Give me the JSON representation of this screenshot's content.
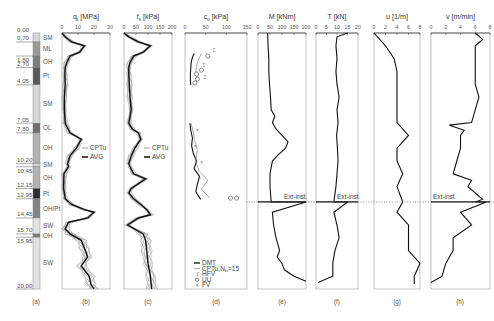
{
  "figure": {
    "depth_axis": {
      "min": 0,
      "max": 20,
      "unit": "m"
    },
    "column_a": {
      "caption": "(a)",
      "boundaries": [
        "0,00",
        "0,70",
        "1,80",
        "2,70",
        "4,05",
        "7,05",
        "7,80",
        "10,20",
        "10,45",
        "12,15",
        "12,95",
        "14,45",
        "15,70",
        "15,95",
        "20,00"
      ],
      "layers": [
        {
          "label": "SM",
          "top": 0.0,
          "bottom": 0.7,
          "shade": "#d6d6d6"
        },
        {
          "label": "ML",
          "top": 0.7,
          "bottom": 1.8,
          "shade": "#9a9a9a"
        },
        {
          "label": "OH",
          "top": 1.8,
          "bottom": 2.7,
          "shade": "#7d7d7d"
        },
        {
          "label": "Pt",
          "top": 2.7,
          "bottom": 4.05,
          "shade": "#585858"
        },
        {
          "label": "SM",
          "top": 4.05,
          "bottom": 7.05,
          "shade": "#d6d6d6"
        },
        {
          "label": "OL",
          "top": 7.05,
          "bottom": 7.8,
          "shade": "#6e6e6e"
        },
        {
          "label": "OH",
          "top": 7.8,
          "bottom": 10.2,
          "shade": "#b2b2b2"
        },
        {
          "label": "SM",
          "top": 10.2,
          "bottom": 10.45,
          "shade": "#d6d6d6"
        },
        {
          "label": "OH",
          "top": 10.45,
          "bottom": 12.15,
          "shade": "#b2b2b2"
        },
        {
          "label": "Pt",
          "top": 12.15,
          "bottom": 12.95,
          "shade": "#2e2e2e"
        },
        {
          "label": "OH/Pt",
          "top": 12.95,
          "bottom": 14.45,
          "shade": "#858585"
        },
        {
          "label": "SW",
          "top": 14.45,
          "bottom": 15.7,
          "shade": "#e2e2e2"
        },
        {
          "label": "OH",
          "top": 15.7,
          "bottom": 15.95,
          "shade": "#7d7d7d"
        },
        {
          "label": "SW",
          "top": 15.95,
          "bottom": 20.0,
          "shade": "#e2e2e2"
        }
      ]
    },
    "ext_inst_label": "Ext-inst.",
    "ext_inst_depth": 13.2
  },
  "chart_data": [
    {
      "type": "line",
      "panel": "(b)",
      "title": "q_t [MPa]",
      "title_main": "q",
      "title_sub": "t",
      "title_unit": " [MPa]",
      "xlim": [
        0,
        30
      ],
      "xticks": [
        "0",
        "10",
        "20",
        "30"
      ],
      "legend": [
        "CPTu",
        "AVG"
      ],
      "series": [
        {
          "name": "AVG",
          "depth": [
            0,
            0.3,
            0.7,
            1.0,
            1.5,
            1.8,
            2.3,
            2.7,
            3.2,
            4.05,
            5,
            6,
            7.05,
            7.3,
            7.8,
            8.3,
            9.0,
            9.6,
            10.2,
            10.45,
            11,
            12.15,
            12.5,
            12.95,
            13.4,
            13.8,
            14.0,
            14.45,
            14.8,
            15.3,
            15.7,
            16.2,
            16.8,
            17.5,
            18.2,
            19,
            19.6,
            20
          ],
          "values": [
            0,
            2,
            6,
            14,
            11,
            5,
            3,
            2,
            1.8,
            2,
            1.5,
            1.5,
            2,
            3,
            5,
            12,
            9,
            5,
            3.5,
            4,
            1.2,
            1.0,
            1.5,
            2,
            6,
            14,
            20,
            16,
            4,
            2,
            5,
            12,
            14,
            16,
            12,
            17,
            18,
            20
          ]
        }
      ]
    },
    {
      "type": "line",
      "panel": "(c)",
      "title": "f_s [kPa]",
      "title_main": "f",
      "title_sub": "s",
      "title_unit": " [kPa]",
      "xlim": [
        0,
        200
      ],
      "xticks": [
        "0",
        "50",
        "100",
        "150",
        "200"
      ],
      "legend": [
        "CPTu",
        "AVG"
      ],
      "series": [
        {
          "name": "AVG",
          "depth": [
            0,
            0.3,
            0.7,
            1.0,
            1.5,
            1.8,
            2.3,
            2.7,
            3.2,
            4.05,
            5,
            6,
            7.05,
            7.5,
            7.8,
            8.3,
            9,
            9.6,
            10.2,
            10.45,
            11,
            11.4,
            12.15,
            12.5,
            12.95,
            13.4,
            13.8,
            14.2,
            14.45,
            15,
            15.7,
            16.2,
            17,
            18,
            19,
            20
          ],
          "values": [
            0,
            20,
            60,
            110,
            80,
            40,
            25,
            20,
            20,
            22,
            25,
            30,
            20,
            35,
            60,
            70,
            45,
            30,
            20,
            25,
            40,
            90,
            30,
            20,
            40,
            70,
            95,
            110,
            60,
            15,
            80,
            90,
            95,
            100,
            110,
            115
          ]
        }
      ]
    },
    {
      "type": "scatter",
      "panel": "(d)",
      "title": "c_u [kPa]",
      "title_main": "c",
      "title_sub": "u",
      "title_unit": " [kPa]",
      "xlim": [
        0,
        150
      ],
      "xticks": [
        "0",
        "50",
        "100",
        "150"
      ],
      "legend": [
        "DMT",
        "CPTu,N_kt=15",
        "HFV",
        "UU",
        "FV"
      ],
      "legend_display": [
        "DMT",
        "CPTu,N",
        "HFV",
        "UU",
        "FV"
      ],
      "series": [
        {
          "name": "DMT",
          "depth": [
            1.6,
            1.9,
            2.3,
            2.7,
            3.2,
            3.7,
            4.05
          ],
          "values": [
            22,
            18,
            15,
            14,
            13,
            13,
            14
          ]
        },
        {
          "name": "DMT",
          "depth": [
            7.05,
            7.6,
            8.2,
            8.8,
            9.4,
            10.0,
            10.6,
            11.2,
            11.8,
            12.4,
            13.0
          ],
          "values": [
            12,
            14,
            18,
            16,
            20,
            28,
            22,
            35,
            30,
            26,
            38
          ]
        },
        {
          "name": "CPTu,N_kt=15",
          "depth": [
            1.6,
            2.1,
            2.6,
            3.1,
            3.6,
            4.05
          ],
          "values": [
            40,
            32,
            28,
            26,
            30,
            22
          ],
          "note": "thin grey line"
        },
        {
          "name": "CPTu,N_kt=15",
          "depth": [
            7.05,
            7.8,
            8.5,
            9.2,
            10,
            10.8,
            11.5,
            12.2,
            12.9
          ],
          "values": [
            15,
            20,
            24,
            30,
            26,
            34,
            55,
            40,
            60
          ]
        },
        {
          "name": "HFV",
          "depth": [
            1.3,
            2.5,
            3.4
          ],
          "values": [
            70,
            45,
            48
          ]
        },
        {
          "name": "UU",
          "depth": [
            1.8,
            2.9,
            3.2,
            3.6,
            3.9,
            12.9,
            12.9
          ],
          "values": [
            55,
            40,
            28,
            30,
            24,
            110,
            125
          ]
        },
        {
          "name": "FV",
          "depth": [
            7.6,
            8.8,
            10.1,
            11.3
          ],
          "values": [
            30,
            25,
            40,
            35
          ]
        }
      ]
    },
    {
      "type": "line",
      "panel": "(e)",
      "title": "M [kNm]",
      "xlim": [
        0,
        200
      ],
      "xticks": [
        "0",
        "50",
        "100",
        "150",
        "200"
      ],
      "series": [
        {
          "name": "M",
          "depth": [
            0,
            1,
            2,
            3,
            4,
            5,
            6,
            6.5,
            7,
            7.5,
            8,
            8.5,
            9,
            9.5,
            10,
            11,
            12,
            13.2,
            13.2,
            14,
            15,
            16,
            17,
            17.5,
            18,
            18.5,
            19,
            19.4
          ],
          "values": [
            40,
            42,
            45,
            45,
            48,
            52,
            55,
            70,
            60,
            75,
            100,
            125,
            115,
            85,
            60,
            50,
            50,
            55,
            200,
            60,
            65,
            75,
            90,
            80,
            100,
            110,
            150,
            200
          ]
        }
      ]
    },
    {
      "type": "line",
      "panel": "(f)",
      "title": "T [kN]",
      "xlim": [
        0,
        20
      ],
      "xticks": [
        "0",
        "5",
        "10",
        "15",
        "20"
      ],
      "series": [
        {
          "name": "T",
          "depth": [
            0,
            0.3,
            1,
            2,
            3,
            4,
            5,
            6,
            7,
            8,
            9,
            10,
            11,
            12,
            13.2,
            13.2,
            14,
            15,
            16,
            17,
            18,
            19,
            19.5
          ],
          "values": [
            15,
            10,
            9.5,
            10,
            9.5,
            10,
            11,
            10,
            10.5,
            9.8,
            10.2,
            10.5,
            10,
            9.5,
            8.5,
            15,
            8.5,
            10,
            11,
            9,
            8,
            8,
            1
          ]
        }
      ]
    },
    {
      "type": "line",
      "panel": "(g)",
      "title": "u [1/m]",
      "xlim": [
        0,
        8
      ],
      "xticks": [
        "0",
        "2",
        "4",
        "6",
        "8"
      ],
      "series": [
        {
          "name": "u",
          "depth": [
            0,
            1,
            2,
            3,
            4,
            5,
            6,
            7,
            8,
            9,
            10,
            11,
            12,
            13.2,
            14,
            15,
            16,
            17,
            18,
            19,
            19.6
          ],
          "values": [
            0,
            2,
            3.5,
            4,
            4,
            4,
            4,
            4,
            6,
            4,
            4,
            5,
            4,
            5,
            4,
            6,
            6,
            6,
            8,
            7,
            7
          ]
        }
      ]
    },
    {
      "type": "line",
      "panel": "(h)",
      "title": "v [m/min]",
      "xlim": [
        0,
        8
      ],
      "xticks": [
        "0",
        "2",
        "4",
        "6",
        "8"
      ],
      "series": [
        {
          "name": "v",
          "depth": [
            0,
            0.5,
            1,
            2,
            3,
            4,
            5,
            6,
            7,
            7.2,
            7.6,
            8,
            9,
            10,
            11,
            11.5,
            12,
            13,
            13.2,
            13.2,
            14,
            15,
            16,
            17,
            18,
            19,
            19.5
          ],
          "values": [
            6,
            7,
            6,
            6,
            6,
            6,
            6.5,
            6,
            5.5,
            2.5,
            4.5,
            4,
            4,
            3.5,
            3,
            5.5,
            5,
            7,
            6,
            7.5,
            4,
            5.5,
            3,
            3,
            2,
            1.5,
            0
          ]
        }
      ]
    }
  ],
  "captions": [
    "(a)",
    "(b)",
    "(c)",
    "(d)",
    "(e)",
    "(f)",
    "(g)",
    "(h)"
  ]
}
